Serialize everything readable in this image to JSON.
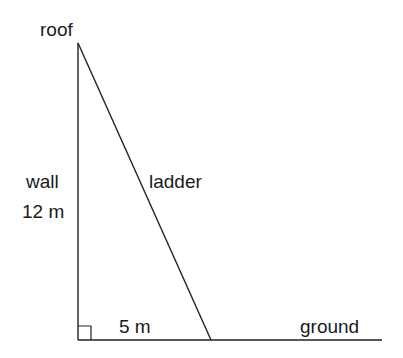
{
  "diagram": {
    "type": "right-triangle ladder problem",
    "labels": {
      "roof": "roof",
      "wall": "wall",
      "wall_length": "12 m",
      "ladder": "ladder",
      "base_length": "5 m",
      "ground": "ground"
    },
    "measurements": {
      "wall_height_m": 12,
      "base_distance_m": 5
    },
    "colors": {
      "line": "#222222",
      "text": "#1a1a1a",
      "background": "#ffffff"
    }
  }
}
